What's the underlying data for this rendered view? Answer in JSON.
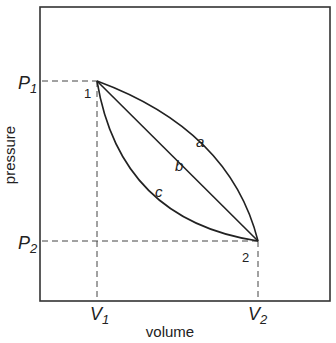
{
  "axes": {
    "xlabel": "volume",
    "ylabel": "pressure",
    "x_ticks": [
      {
        "main": "V",
        "sub": "1"
      },
      {
        "main": "V",
        "sub": "2"
      }
    ],
    "y_ticks": [
      {
        "main": "P",
        "sub": "1"
      },
      {
        "main": "P",
        "sub": "2"
      }
    ]
  },
  "points": [
    {
      "label": "1",
      "coords": "(V1, P1)"
    },
    {
      "label": "2",
      "coords": "(V2, P2)"
    }
  ],
  "curves": [
    {
      "label": "a",
      "shape": "concave (bulges away from origin)"
    },
    {
      "label": "b",
      "shape": "straight line"
    },
    {
      "label": "c",
      "shape": "convex (bulges toward origin)"
    }
  ]
}
